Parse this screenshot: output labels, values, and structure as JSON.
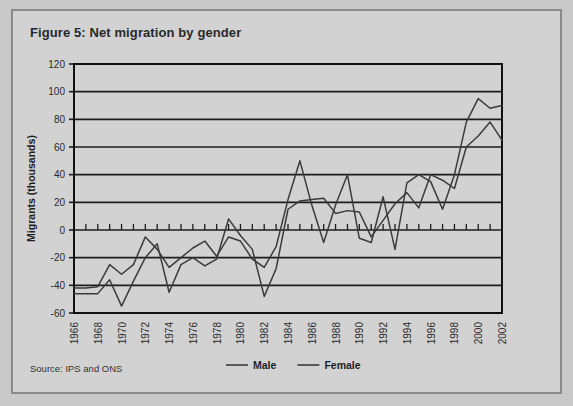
{
  "figure": {
    "title": "Figure 5: Net migration by gender",
    "source": "Source: IPS and ONS"
  },
  "legend": {
    "items": [
      {
        "label": "Male"
      },
      {
        "label": "Female"
      }
    ]
  },
  "colors": {
    "card_background": "#d2d2d2",
    "page_background": "#c9c9c9",
    "card_border": "#8a8a8a",
    "line": "#3b3b3b",
    "axis": "#111111",
    "grid": "#1c1c1c"
  },
  "chart_data": {
    "type": "line",
    "title": "Figure 5: Net migration by gender",
    "xlabel": "",
    "ylabel": "Migrants (thousands)",
    "ylim": [
      -60,
      120
    ],
    "ytick_step": 20,
    "yticks": [
      120,
      100,
      80,
      60,
      40,
      20,
      0,
      -20,
      -40,
      -60
    ],
    "ytick_labels": [
      "120",
      "100",
      "80",
      "60",
      "40",
      "20",
      "0",
      "-20",
      "-40",
      "-60"
    ],
    "grid": true,
    "grid_axis": "y",
    "legend_position": "bottom",
    "x": [
      1966,
      1967,
      1968,
      1969,
      1970,
      1971,
      1972,
      1973,
      1974,
      1975,
      1976,
      1977,
      1978,
      1979,
      1980,
      1981,
      1982,
      1983,
      1984,
      1985,
      1986,
      1987,
      1988,
      1989,
      1990,
      1991,
      1992,
      1993,
      1994,
      1995,
      1996,
      1997,
      1998,
      1999,
      2000,
      2001,
      2002
    ],
    "xticks": [
      1966,
      1968,
      1970,
      1972,
      1974,
      1976,
      1978,
      1980,
      1982,
      1984,
      1986,
      1988,
      1990,
      1992,
      1994,
      1996,
      1998,
      2000,
      2002
    ],
    "xtick_labels": [
      "1966",
      "1968",
      "1970",
      "1972",
      "1974",
      "1976",
      "1978",
      "1980",
      "1982",
      "1984",
      "1986",
      "1988",
      "1990",
      "1992",
      "1994",
      "1996",
      "1998",
      "2000",
      "2002"
    ],
    "xlim": [
      1966,
      2002
    ],
    "series": [
      {
        "name": "Male",
        "values": [
          -42,
          -42,
          -41,
          -25,
          -32,
          -25,
          -5,
          -14,
          -27,
          -20,
          -13,
          -8,
          -19,
          -5,
          -8,
          -21,
          -27,
          -12,
          22,
          50,
          18,
          -9,
          18,
          40,
          -6,
          -9,
          24,
          -14,
          34,
          40,
          35,
          15,
          40,
          78,
          95,
          88,
          90
        ]
      },
      {
        "name": "Female",
        "values": [
          -46,
          -46,
          -46,
          -36,
          -55,
          -37,
          -20,
          -10,
          -45,
          -25,
          -20,
          -26,
          -21,
          8,
          -4,
          -14,
          -48,
          -28,
          15,
          21,
          22,
          23,
          12,
          14,
          13,
          -5,
          7,
          19,
          27,
          16,
          40,
          36,
          30,
          60,
          68,
          78,
          65
        ]
      }
    ]
  }
}
